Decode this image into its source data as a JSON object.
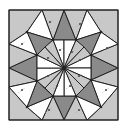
{
  "diagram": {
    "title": "",
    "kind": "geometric-tiling",
    "canvas": {
      "width": 127,
      "height": 130
    },
    "frame": {
      "x": 9,
      "y": 10,
      "width": 109,
      "height": 110
    },
    "center": [
      64,
      68
    ],
    "colors": {
      "background": "#ffffff",
      "frame_fill": "#c4c4c4",
      "dark": "#8a8a8a",
      "light": "#c8c8c8",
      "white": "#ffffff",
      "stroke": "#222222",
      "mark": "#444444",
      "dash": "#9a9a9a"
    },
    "vertices": {
      "outer_top": [
        [
          42,
          10
        ],
        [
          64,
          10
        ],
        [
          87,
          10
        ]
      ],
      "outer_right": [
        [
          118,
          44
        ],
        [
          118,
          68
        ],
        [
          118,
          87
        ]
      ],
      "outer_bottom": [
        [
          42,
          120
        ],
        [
          64,
          120
        ],
        [
          87,
          120
        ]
      ],
      "outer_left": [
        [
          9,
          44
        ],
        [
          9,
          68
        ],
        [
          9,
          87
        ]
      ],
      "mid_ring": [
        [
          27,
          32
        ],
        [
          101,
          32
        ],
        [
          101,
          107
        ],
        [
          27,
          107
        ]
      ],
      "octagon": [
        [
          53,
          40
        ],
        [
          76,
          40
        ],
        [
          91,
          55
        ],
        [
          91,
          80
        ],
        [
          76,
          96
        ],
        [
          53,
          96
        ],
        [
          37,
          81
        ],
        [
          37,
          55
        ]
      ]
    },
    "polygons": [
      {
        "id": "corner-tl",
        "fill": "light",
        "points": [
          [
            9,
            10
          ],
          [
            42,
            10
          ],
          [
            27,
            32
          ],
          [
            9,
            44
          ]
        ]
      },
      {
        "id": "corner-tr",
        "fill": "light",
        "points": [
          [
            87,
            10
          ],
          [
            118,
            10
          ],
          [
            118,
            44
          ],
          [
            101,
            32
          ]
        ]
      },
      {
        "id": "corner-br",
        "fill": "light",
        "points": [
          [
            118,
            87
          ],
          [
            118,
            120
          ],
          [
            87,
            120
          ],
          [
            101,
            107
          ]
        ]
      },
      {
        "id": "corner-bl",
        "fill": "light",
        "points": [
          [
            9,
            87
          ],
          [
            27,
            107
          ],
          [
            42,
            120
          ],
          [
            9,
            120
          ]
        ]
      },
      {
        "id": "top-dark",
        "fill": "dark",
        "points": [
          [
            64,
            10
          ],
          [
            76,
            40
          ],
          [
            53,
            40
          ]
        ]
      },
      {
        "id": "top-light-l",
        "fill": "light",
        "points": [
          [
            42,
            10
          ],
          [
            64,
            10
          ],
          [
            53,
            40
          ]
        ]
      },
      {
        "id": "top-light-r",
        "fill": "light",
        "points": [
          [
            64,
            10
          ],
          [
            87,
            10
          ],
          [
            76,
            40
          ]
        ]
      },
      {
        "id": "right-dark",
        "fill": "dark",
        "points": [
          [
            118,
            68
          ],
          [
            91,
            80
          ],
          [
            91,
            55
          ]
        ]
      },
      {
        "id": "right-light-t",
        "fill": "light",
        "points": [
          [
            118,
            44
          ],
          [
            118,
            68
          ],
          [
            91,
            55
          ]
        ]
      },
      {
        "id": "right-light-b",
        "fill": "light",
        "points": [
          [
            118,
            68
          ],
          [
            118,
            87
          ],
          [
            91,
            80
          ]
        ]
      },
      {
        "id": "bottom-dark",
        "fill": "dark",
        "points": [
          [
            64,
            120
          ],
          [
            53,
            96
          ],
          [
            76,
            96
          ]
        ]
      },
      {
        "id": "bottom-light-l",
        "fill": "light",
        "points": [
          [
            42,
            120
          ],
          [
            53,
            96
          ],
          [
            64,
            120
          ]
        ]
      },
      {
        "id": "bottom-light-r",
        "fill": "light",
        "points": [
          [
            64,
            120
          ],
          [
            76,
            96
          ],
          [
            87,
            120
          ]
        ]
      },
      {
        "id": "left-dark",
        "fill": "dark",
        "points": [
          [
            9,
            68
          ],
          [
            37,
            55
          ],
          [
            37,
            81
          ]
        ]
      },
      {
        "id": "left-light-t",
        "fill": "light",
        "points": [
          [
            9,
            44
          ],
          [
            37,
            55
          ],
          [
            9,
            68
          ]
        ]
      },
      {
        "id": "left-light-b",
        "fill": "light",
        "points": [
          [
            9,
            68
          ],
          [
            37,
            81
          ],
          [
            9,
            87
          ]
        ]
      },
      {
        "id": "tl-white-a",
        "fill": "white",
        "points": [
          [
            42,
            10
          ],
          [
            53,
            40
          ],
          [
            27,
            32
          ]
        ]
      },
      {
        "id": "tl-dark",
        "fill": "dark",
        "points": [
          [
            27,
            32
          ],
          [
            53,
            40
          ],
          [
            37,
            55
          ]
        ]
      },
      {
        "id": "tl-white-b",
        "fill": "white",
        "points": [
          [
            9,
            44
          ],
          [
            27,
            32
          ],
          [
            37,
            55
          ]
        ]
      },
      {
        "id": "tr-white-a",
        "fill": "white",
        "points": [
          [
            87,
            10
          ],
          [
            101,
            32
          ],
          [
            76,
            40
          ]
        ]
      },
      {
        "id": "tr-dark",
        "fill": "dark",
        "points": [
          [
            101,
            32
          ],
          [
            91,
            55
          ],
          [
            76,
            40
          ]
        ]
      },
      {
        "id": "tr-white-b",
        "fill": "white",
        "points": [
          [
            118,
            44
          ],
          [
            91,
            55
          ],
          [
            101,
            32
          ]
        ]
      },
      {
        "id": "br-white-a",
        "fill": "white",
        "points": [
          [
            118,
            87
          ],
          [
            101,
            107
          ],
          [
            91,
            80
          ]
        ]
      },
      {
        "id": "br-dark",
        "fill": "dark",
        "points": [
          [
            101,
            107
          ],
          [
            76,
            96
          ],
          [
            91,
            80
          ]
        ]
      },
      {
        "id": "br-white-b",
        "fill": "white",
        "points": [
          [
            87,
            120
          ],
          [
            76,
            96
          ],
          [
            101,
            107
          ]
        ]
      },
      {
        "id": "bl-white-a",
        "fill": "white",
        "points": [
          [
            42,
            120
          ],
          [
            27,
            107
          ],
          [
            53,
            96
          ]
        ]
      },
      {
        "id": "bl-dark",
        "fill": "dark",
        "points": [
          [
            27,
            107
          ],
          [
            37,
            81
          ],
          [
            53,
            96
          ]
        ]
      },
      {
        "id": "bl-white-b",
        "fill": "white",
        "points": [
          [
            9,
            87
          ],
          [
            37,
            81
          ],
          [
            27,
            107
          ]
        ]
      },
      {
        "id": "oct-1",
        "fill": "white",
        "points": [
          [
            64,
            68
          ],
          [
            53,
            40
          ],
          [
            64,
            40
          ]
        ]
      },
      {
        "id": "oct-2",
        "fill": "white",
        "points": [
          [
            64,
            68
          ],
          [
            64,
            40
          ],
          [
            76,
            40
          ]
        ]
      },
      {
        "id": "oct-3",
        "fill": "light",
        "points": [
          [
            64,
            68
          ],
          [
            76,
            40
          ],
          [
            84,
            47
          ]
        ]
      },
      {
        "id": "oct-4",
        "fill": "light",
        "points": [
          [
            64,
            68
          ],
          [
            84,
            47
          ],
          [
            91,
            55
          ]
        ]
      },
      {
        "id": "oct-5",
        "fill": "white",
        "points": [
          [
            64,
            68
          ],
          [
            91,
            55
          ],
          [
            91,
            68
          ]
        ]
      },
      {
        "id": "oct-6",
        "fill": "white",
        "points": [
          [
            64,
            68
          ],
          [
            91,
            68
          ],
          [
            91,
            80
          ]
        ]
      },
      {
        "id": "oct-7",
        "fill": "light",
        "points": [
          [
            64,
            68
          ],
          [
            91,
            80
          ],
          [
            84,
            88
          ]
        ]
      },
      {
        "id": "oct-8",
        "fill": "light",
        "points": [
          [
            64,
            68
          ],
          [
            84,
            88
          ],
          [
            76,
            96
          ]
        ]
      },
      {
        "id": "oct-9",
        "fill": "white",
        "points": [
          [
            64,
            68
          ],
          [
            76,
            96
          ],
          [
            64,
            96
          ]
        ]
      },
      {
        "id": "oct-10",
        "fill": "white",
        "points": [
          [
            64,
            68
          ],
          [
            64,
            96
          ],
          [
            53,
            96
          ]
        ]
      },
      {
        "id": "oct-11",
        "fill": "light",
        "points": [
          [
            64,
            68
          ],
          [
            53,
            96
          ],
          [
            45,
            88
          ]
        ]
      },
      {
        "id": "oct-12",
        "fill": "light",
        "points": [
          [
            64,
            68
          ],
          [
            45,
            88
          ],
          [
            37,
            81
          ]
        ]
      },
      {
        "id": "oct-13",
        "fill": "white",
        "points": [
          [
            64,
            68
          ],
          [
            37,
            81
          ],
          [
            37,
            68
          ]
        ]
      },
      {
        "id": "oct-14",
        "fill": "white",
        "points": [
          [
            64,
            68
          ],
          [
            37,
            68
          ],
          [
            37,
            55
          ]
        ]
      },
      {
        "id": "oct-15",
        "fill": "light",
        "points": [
          [
            64,
            68
          ],
          [
            37,
            55
          ],
          [
            45,
            47
          ]
        ]
      },
      {
        "id": "oct-16",
        "fill": "light",
        "points": [
          [
            64,
            68
          ],
          [
            45,
            47
          ],
          [
            53,
            40
          ]
        ]
      }
    ],
    "vertex_dots": [
      [
        53,
        40
      ],
      [
        76,
        40
      ],
      [
        91,
        55
      ],
      [
        91,
        80
      ],
      [
        76,
        96
      ],
      [
        53,
        96
      ],
      [
        37,
        81
      ],
      [
        37,
        55
      ],
      [
        64,
        68
      ],
      [
        27,
        32
      ],
      [
        101,
        32
      ],
      [
        101,
        107
      ],
      [
        27,
        107
      ]
    ],
    "marks": [
      [
        50,
        22
      ],
      [
        80,
        24
      ],
      [
        22,
        44
      ],
      [
        107,
        48
      ],
      [
        22,
        90
      ],
      [
        106,
        90
      ],
      [
        49,
        110
      ],
      [
        79,
        110
      ],
      [
        60,
        50
      ],
      [
        72,
        52
      ],
      [
        80,
        60
      ],
      [
        79,
        76
      ],
      [
        70,
        86
      ],
      [
        57,
        86
      ],
      [
        48,
        76
      ],
      [
        48,
        58
      ]
    ]
  }
}
